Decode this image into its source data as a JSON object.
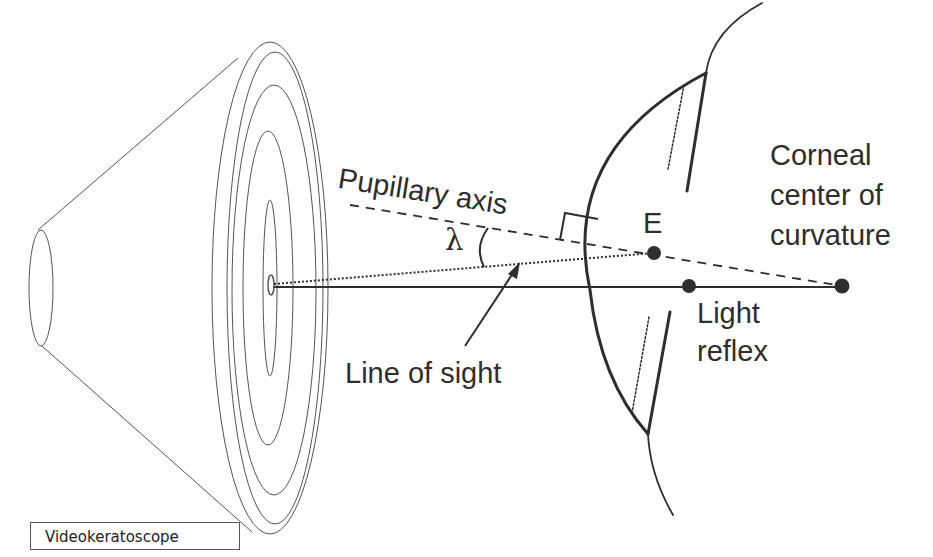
{
  "diagram": {
    "labels": {
      "pupillary_axis": "Pupillary axis",
      "lambda": "λ",
      "line_of_sight": "Line of sight",
      "e_point": "E",
      "light_reflex_line1": "Light",
      "light_reflex_line2": "reflex",
      "corneal_line1": "Corneal",
      "corneal_line2": "center of",
      "corneal_line3": "curvature"
    },
    "caption": "Videokeratoscope",
    "colors": {
      "ink": "#2e2e2e",
      "thin_line": "#555555",
      "background": "#ffffff"
    }
  }
}
